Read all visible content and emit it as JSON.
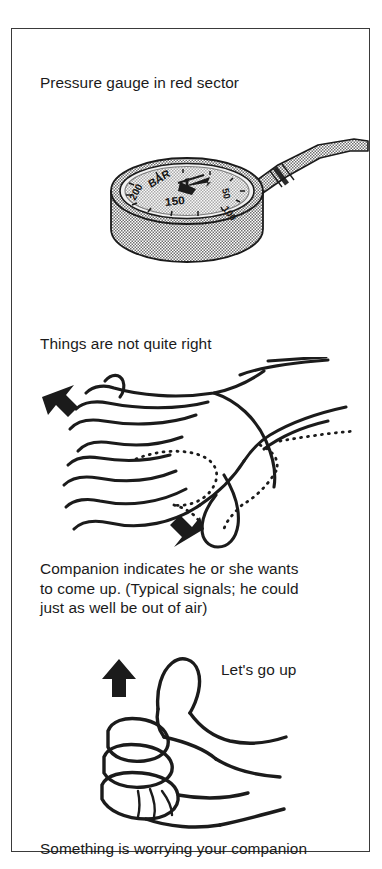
{
  "page": {
    "background_color": "#ffffff",
    "frame_border_color": "#3a3a3a",
    "ink_color": "#1b1b1b",
    "shade_color": "#b3b3b3"
  },
  "panels": [
    {
      "id": "pressure-gauge",
      "caption": "Pressure gauge in red sector",
      "illustration": "submersible-pressure-gauge-with-hose",
      "gauge": {
        "unit_label": "BAR",
        "dial_numbers": [
          "50",
          "100",
          "150",
          "200"
        ],
        "needle_reading_zone": "red sector",
        "needle_value": "low"
      }
    },
    {
      "id": "hand-wobble",
      "caption": "Things are not quite right",
      "illustration": "flat-hand-rocking-side-to-side",
      "arrows": [
        {
          "name": "rock-arrow-up-left",
          "direction": "up-left"
        },
        {
          "name": "rock-arrow-down-right",
          "direction": "down-left"
        }
      ],
      "motion_outline": "dotted-second-position"
    },
    {
      "id": "signal-explanation",
      "caption": "Companion indicates he or she wants\nto come up. (Typical signals; he could\njust as well be out of air)"
    },
    {
      "id": "thumbs-up",
      "caption": "Let's go up",
      "illustration": "thumbs-up-hand",
      "arrows": [
        {
          "name": "ascend-arrow-up",
          "direction": "up"
        }
      ]
    },
    {
      "id": "summary",
      "caption": "Something is worrying your companion"
    }
  ]
}
